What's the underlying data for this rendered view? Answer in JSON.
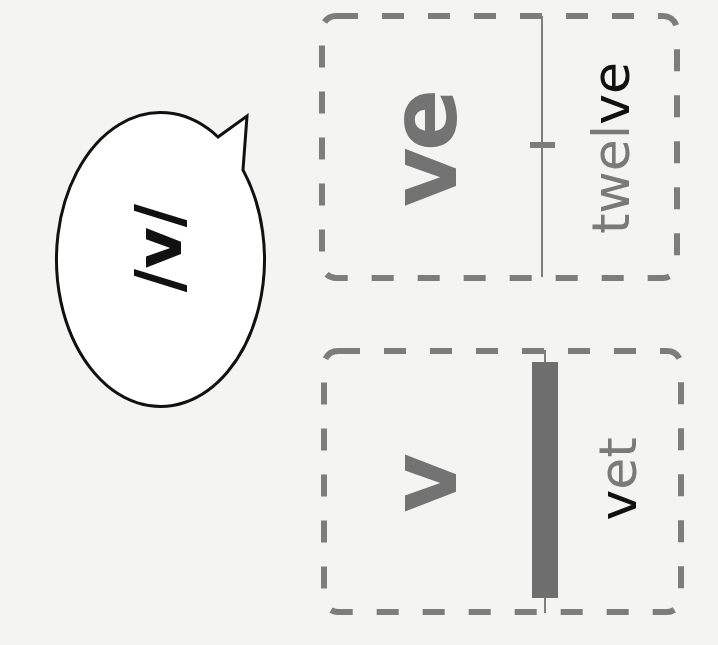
{
  "speech_bubble": {
    "phoneme": "/v/"
  },
  "cards": [
    {
      "grapheme": "ve",
      "example_word": {
        "prefix": "twel",
        "highlight": "ve",
        "suffix": ""
      }
    },
    {
      "grapheme": "v",
      "example_word": {
        "prefix": "",
        "highlight": "v",
        "suffix": "et"
      }
    }
  ],
  "colors": {
    "background": "#f4f4f2",
    "grapheme": "#737373",
    "highlight": "#111111",
    "word": "#7a7a7a",
    "dashed_border": "#7d7d7d",
    "outline": "#111111"
  }
}
